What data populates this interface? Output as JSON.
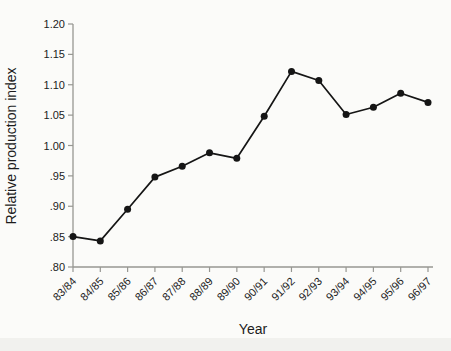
{
  "chart_data": {
    "type": "line",
    "title": "",
    "xlabel": "Year",
    "ylabel": "Relative production index",
    "categories": [
      "83/84",
      "84/85",
      "85/86",
      "86/87",
      "87/88",
      "88/89",
      "89/90",
      "90/91",
      "91/92",
      "92/93",
      "93/94",
      "94/95",
      "95/96",
      "96/97"
    ],
    "values": [
      0.85,
      0.843,
      0.895,
      0.948,
      0.966,
      0.988,
      0.979,
      1.048,
      1.122,
      1.107,
      1.051,
      1.063,
      1.086,
      1.071
    ],
    "ylim": [
      0.8,
      1.2
    ],
    "ytick_values": [
      1.2,
      1.15,
      1.1,
      1.05,
      1.0,
      0.95,
      0.9,
      0.85,
      0.8
    ],
    "ytick_labels": [
      "1.20",
      "1.15",
      "1.10",
      "1.05",
      "1.00",
      ".95",
      ".90",
      ".85",
      ".80"
    ],
    "grid": false,
    "legend": "none",
    "marker": "filled-circle",
    "line_color": "#151515",
    "marker_color": "#151515",
    "axis_color": "#979792",
    "text_color": "#1c1c1c"
  }
}
